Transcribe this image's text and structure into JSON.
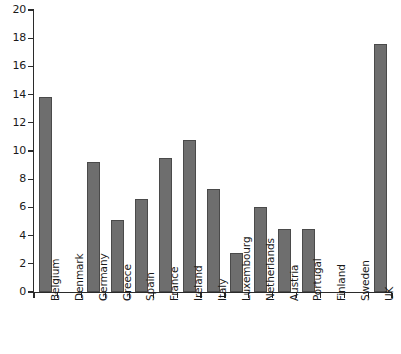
{
  "chart_data": {
    "type": "bar",
    "title": "",
    "xlabel": "",
    "ylabel": "",
    "ylim": [
      0,
      20
    ],
    "ytick_step": 2,
    "yticks": [
      "0",
      "2",
      "4",
      "6",
      "8",
      "10",
      "12",
      "14",
      "16",
      "18",
      "20"
    ],
    "grid": false,
    "legend": null,
    "categories": [
      "Belgium",
      "Denmark",
      "Germany",
      "Greece",
      "Spain",
      "France",
      "Ireland",
      "Italy",
      "Luxembourg",
      "Netherlands",
      "Austria",
      "Portugal",
      "Finland",
      "Sweden",
      "UK"
    ],
    "values": [
      13.8,
      0,
      9.2,
      5.1,
      6.6,
      9.5,
      10.8,
      7.3,
      2.8,
      6.0,
      4.5,
      4.5,
      0,
      0,
      17.6
    ],
    "bar_color": "#6e6e6e",
    "bar_edge_color": "#4a4a4a",
    "axis_color": "#2b2b2b",
    "background_color": "#ffffff"
  }
}
